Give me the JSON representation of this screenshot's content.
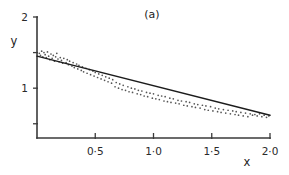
{
  "chart_data": {
    "type": "scatter",
    "title": "(a)",
    "xlabel": "x",
    "ylabel": "y",
    "xlim": [
      0,
      2.0
    ],
    "ylim": [
      0.3,
      2.0
    ],
    "grid": false,
    "legend": null,
    "x_ticks": [
      {
        "value": 0.5,
        "label": "0·5"
      },
      {
        "value": 1.0,
        "label": "1·0"
      },
      {
        "value": 1.5,
        "label": "1·5"
      },
      {
        "value": 2.0,
        "label": "2·0"
      }
    ],
    "y_ticks": [
      {
        "value": 0.5,
        "label": ""
      },
      {
        "value": 1.0,
        "label": "1"
      },
      {
        "value": 1.5,
        "label": ""
      },
      {
        "value": 2.0,
        "label": "2"
      }
    ],
    "fit_line": {
      "name": "fitted regression line",
      "x_start": 0.0,
      "y_start": 1.45,
      "x_end": 2.0,
      "y_end": 0.62,
      "slope": -0.415,
      "intercept": 1.45
    },
    "series": [
      {
        "name": "observations",
        "marker": "dot",
        "x": [
          0.02,
          0.03,
          0.04,
          0.05,
          0.06,
          0.07,
          0.08,
          0.09,
          0.1,
          0.11,
          0.12,
          0.13,
          0.14,
          0.15,
          0.16,
          0.17,
          0.18,
          0.19,
          0.2,
          0.21,
          0.22,
          0.23,
          0.25,
          0.26,
          0.27,
          0.28,
          0.3,
          0.31,
          0.32,
          0.34,
          0.35,
          0.36,
          0.38,
          0.39,
          0.4,
          0.42,
          0.43,
          0.45,
          0.46,
          0.48,
          0.49,
          0.5,
          0.52,
          0.53,
          0.55,
          0.56,
          0.58,
          0.59,
          0.61,
          0.62,
          0.64,
          0.65,
          0.67,
          0.68,
          0.7,
          0.71,
          0.73,
          0.74,
          0.76,
          0.78,
          0.79,
          0.81,
          0.82,
          0.84,
          0.86,
          0.87,
          0.89,
          0.9,
          0.92,
          0.94,
          0.95,
          0.97,
          0.99,
          1.0,
          1.02,
          1.04,
          1.05,
          1.07,
          1.09,
          1.1,
          1.12,
          1.14,
          1.15,
          1.17,
          1.19,
          1.21,
          1.22,
          1.24,
          1.26,
          1.28,
          1.29,
          1.31,
          1.33,
          1.35,
          1.36,
          1.38,
          1.4,
          1.42,
          1.44,
          1.45,
          1.47,
          1.49,
          1.51,
          1.53,
          1.55,
          1.56,
          1.58,
          1.6,
          1.62,
          1.64,
          1.66,
          1.68,
          1.7,
          1.71,
          1.73,
          1.75,
          1.77,
          1.79,
          1.81,
          1.83,
          1.85,
          1.87,
          1.89,
          1.91,
          1.93,
          1.95,
          1.97,
          1.99
        ],
        "y": [
          1.49,
          1.46,
          1.52,
          1.44,
          1.5,
          1.47,
          1.43,
          1.51,
          1.45,
          1.4,
          1.48,
          1.42,
          1.46,
          1.38,
          1.44,
          1.49,
          1.41,
          1.37,
          1.43,
          1.39,
          1.35,
          1.42,
          1.36,
          1.4,
          1.33,
          1.38,
          1.31,
          1.36,
          1.29,
          1.34,
          1.27,
          1.32,
          1.25,
          1.3,
          1.23,
          1.28,
          1.21,
          1.26,
          1.19,
          1.24,
          1.17,
          1.22,
          1.15,
          1.2,
          1.13,
          1.18,
          1.11,
          1.16,
          1.09,
          1.14,
          1.07,
          1.12,
          1.02,
          1.08,
          1.0,
          1.06,
          0.98,
          1.04,
          0.97,
          1.02,
          0.95,
          1.0,
          0.94,
          0.99,
          0.92,
          0.97,
          0.91,
          0.96,
          0.89,
          0.94,
          0.88,
          0.93,
          0.86,
          0.92,
          0.85,
          0.9,
          0.84,
          0.89,
          0.82,
          0.88,
          0.81,
          0.86,
          0.8,
          0.85,
          0.79,
          0.83,
          0.78,
          0.82,
          0.76,
          0.81,
          0.75,
          0.8,
          0.74,
          0.78,
          0.73,
          0.77,
          0.72,
          0.76,
          0.7,
          0.75,
          0.69,
          0.74,
          0.68,
          0.72,
          0.67,
          0.71,
          0.66,
          0.7,
          0.65,
          0.69,
          0.64,
          0.68,
          0.63,
          0.67,
          0.62,
          0.66,
          0.61,
          0.65,
          0.6,
          0.64,
          0.62,
          0.63,
          0.61,
          0.64,
          0.6,
          0.62,
          0.59,
          0.61
        ]
      }
    ]
  }
}
